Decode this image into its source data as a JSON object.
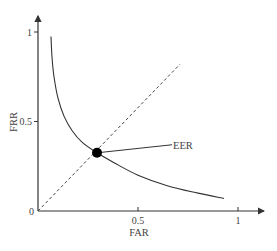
{
  "chart_data": {
    "type": "line",
    "title": "",
    "xlabel": "FAR",
    "ylabel": "FRR",
    "xlim": [
      0,
      1.1
    ],
    "ylim": [
      0,
      1.1
    ],
    "xticks": [
      {
        "value": 0.5,
        "label": "0.5"
      },
      {
        "value": 1,
        "label": "1"
      }
    ],
    "yticks": [
      {
        "value": 0.5,
        "label": "0.5"
      },
      {
        "value": 1,
        "label": "1"
      }
    ],
    "origin_label": "0",
    "grid": false,
    "series": [
      {
        "name": "DET curve",
        "style": "solid",
        "x": [
          0.065,
          0.07,
          0.08,
          0.1,
          0.13,
          0.17,
          0.22,
          0.295,
          0.38,
          0.5,
          0.65,
          0.8,
          0.93
        ],
        "y": [
          0.975,
          0.86,
          0.75,
          0.63,
          0.53,
          0.45,
          0.385,
          0.325,
          0.27,
          0.2,
          0.14,
          0.1,
          0.07
        ]
      },
      {
        "name": "FAR = FRR line",
        "style": "dashed",
        "x": [
          0,
          0.71
        ],
        "y": [
          0,
          0.82
        ]
      }
    ],
    "annotations": [
      {
        "text": "EER",
        "point": {
          "x": 0.295,
          "y": 0.325
        },
        "marker": "filled-circle",
        "label_at": {
          "x": 0.67,
          "y": 0.37
        }
      }
    ]
  },
  "colors": {
    "axis": "#333333",
    "curve": "#333333",
    "dashed": "#444444",
    "marker": "#000000",
    "text": "#444444"
  }
}
